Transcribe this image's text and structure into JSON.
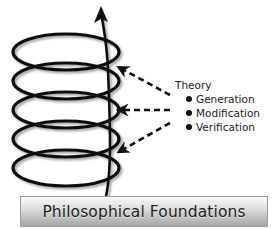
{
  "theory": {
    "title": "Theory",
    "items": [
      {
        "label": "Generation"
      },
      {
        "label": "Modification"
      },
      {
        "label": "Verification"
      }
    ]
  },
  "foundation": {
    "label": "Philosophical Foundations"
  },
  "diagram": {
    "spiral_coils": 5,
    "arrows": 3,
    "spiral_color": "#111111",
    "arrow_color": "#111111"
  }
}
